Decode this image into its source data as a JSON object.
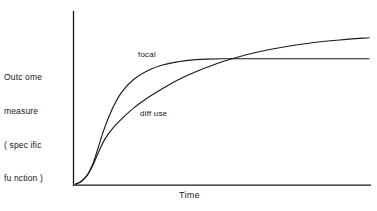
{
  "chart_data": {
    "type": "line",
    "title": "",
    "xlabel": "Time",
    "ylabel_lines": [
      "Outc ome",
      "measure",
      "( spec ific",
      "fu nction )"
    ],
    "ylabel": "Outcome measure (specific function)",
    "xlim": [
      0,
      100
    ],
    "ylim": [
      0,
      100
    ],
    "grid": false,
    "legend_position": "inline-annotations",
    "axis_ticks": {
      "x": [],
      "y": []
    },
    "axes_shown": [
      "left",
      "bottom"
    ],
    "series": [
      {
        "name": "focal",
        "label": "focal",
        "color": "#1a1a1a",
        "x": [
          0,
          2,
          4,
          6,
          8,
          10,
          13,
          16,
          20,
          25,
          30,
          35,
          40,
          45,
          50,
          60,
          70,
          80,
          90,
          100
        ],
        "y": [
          0,
          2,
          6,
          14,
          26,
          38,
          52,
          62,
          70,
          76,
          79.5,
          81.5,
          82.8,
          83.3,
          83.5,
          83.5,
          83.5,
          83.5,
          83.5,
          83.5
        ]
      },
      {
        "name": "diffuse",
        "label": "diff use",
        "color": "#1a1a1a",
        "x": [
          0,
          2,
          4,
          6,
          8,
          10,
          13,
          16,
          20,
          25,
          30,
          35,
          40,
          45,
          50,
          60,
          70,
          80,
          90,
          100
        ],
        "y": [
          0,
          2,
          6,
          13,
          22,
          30,
          38,
          44,
          51,
          58,
          64,
          69.5,
          74,
          78,
          81.5,
          87,
          91,
          94,
          96,
          97.5
        ]
      }
    ],
    "annotations": [
      {
        "text": "focal",
        "series": "focal"
      },
      {
        "text": "diff use",
        "series": "diffuse"
      }
    ]
  }
}
